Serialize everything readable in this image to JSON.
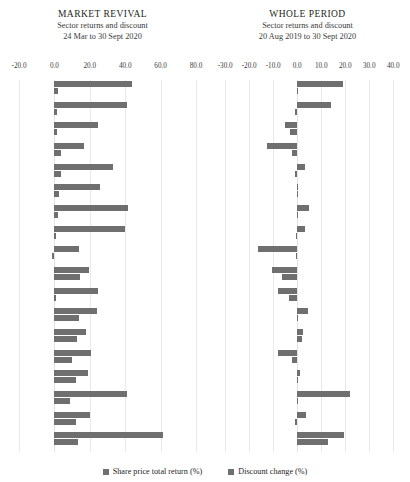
{
  "legend": {
    "items": [
      {
        "label": "Share price total return (%)",
        "color": "#6f6f6f",
        "key": "return"
      },
      {
        "label": "Discount change (%)",
        "color": "#6f6f6f",
        "key": "discount"
      }
    ]
  },
  "panels": [
    {
      "title": "MARKET REVIVAL",
      "subtitle_1": "Sector returns and discount",
      "subtitle_2": "24 Mar to 30 Sept 2020"
    },
    {
      "title": "WHOLE PERIOD",
      "subtitle_1": "Sector returns and discount",
      "subtitle_2": "20 Aug 2019 to 30 Sept 2020"
    }
  ],
  "chart_data": [
    {
      "type": "bar",
      "orientation": "horizontal",
      "title": "MARKET REVIVAL",
      "subtitle": "Sector returns and discount 24 Mar to 30 Sept 2020",
      "xlabel": "",
      "ylabel": "",
      "xlim": [
        -20.0,
        80.0
      ],
      "xticks": [
        -20.0,
        0.0,
        20.0,
        40.0,
        60.0,
        80.0
      ],
      "xtick_labels": [
        "-20.0",
        "0.0",
        "20.0",
        "40.0",
        "60.0",
        "80.0"
      ],
      "grid": true,
      "legend_position": "bottom",
      "categories": [
        "1",
        "2",
        "3",
        "4",
        "5",
        "6",
        "7",
        "8",
        "9",
        "10",
        "11",
        "12",
        "13",
        "14",
        "15",
        "16",
        "17",
        "18"
      ],
      "series": [
        {
          "name": "Share price total return (%)",
          "color": "#6f6f6f",
          "values": [
            44.0,
            41.0,
            24.6,
            17.0,
            33.2,
            25.6,
            41.6,
            39.8,
            13.9,
            19.6,
            24.9,
            24.0,
            17.8,
            20.7,
            19.0,
            41.0,
            20.3,
            61.5
          ]
        },
        {
          "name": "Discount change (%)",
          "color": "#6f6f6f",
          "values": [
            2.1,
            1.6,
            1.3,
            3.8,
            3.6,
            2.6,
            2.2,
            0.9,
            -1.2,
            14.7,
            0.2,
            13.8,
            12.6,
            10.2,
            12.2,
            8.9,
            12.3,
            13.6
          ]
        }
      ]
    },
    {
      "type": "bar",
      "orientation": "horizontal",
      "title": "WHOLE PERIOD",
      "subtitle": "Sector returns and discount 20 Aug 2019 to 30 Sept 2020",
      "xlabel": "",
      "ylabel": "",
      "xlim": [
        -33.0,
        42.0
      ],
      "xticks": [
        -30.0,
        -20.0,
        -10.0,
        0.0,
        10.0,
        20.0,
        30.0,
        40.0
      ],
      "xtick_labels": [
        "-30.0",
        "-20.0",
        "-10.0",
        "0.0",
        "10.0",
        "20.0",
        "30.0",
        "40.0"
      ],
      "grid": true,
      "legend_position": "bottom",
      "categories": [
        "1",
        "2",
        "3",
        "4",
        "5",
        "6",
        "7",
        "8",
        "9",
        "10",
        "11",
        "12",
        "13",
        "14",
        "15",
        "16",
        "17",
        "18"
      ],
      "series": [
        {
          "name": "Share price total return (%)",
          "color": "#6f6f6f",
          "values": [
            18.9,
            13.9,
            -5.2,
            -12.6,
            3.4,
            0.2,
            5.1,
            3.1,
            -16.4,
            -10.4,
            -8.0,
            4.5,
            2.5,
            -8.1,
            1.3,
            22.2,
            3.6,
            19.6
          ]
        },
        {
          "name": "Discount change (%)",
          "color": "#6f6f6f",
          "values": [
            0.3,
            -0.8,
            -3.0,
            -2.1,
            -0.9,
            0.1,
            0.2,
            -0.7,
            -0.6,
            -6.2,
            -3.4,
            0.3,
            2.1,
            -2.0,
            0.4,
            0.5,
            -0.9,
            12.9
          ]
        }
      ]
    }
  ]
}
